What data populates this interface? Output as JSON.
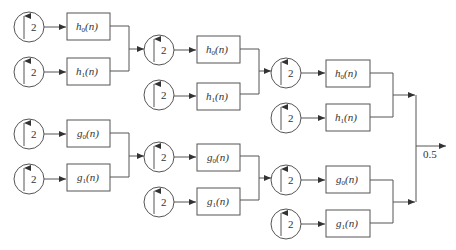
{
  "diagram": {
    "type": "synthesis filter bank tree",
    "upsample_factor": "2",
    "output_gain": "0.5",
    "stages": [
      {
        "name": "stage-1",
        "blocks": [
          {
            "filter": "h",
            "sub": "0",
            "arg": "(n)",
            "factor": "2"
          },
          {
            "filter": "h",
            "sub": "1",
            "arg": "(n)",
            "factor": "2"
          },
          {
            "filter": "g",
            "sub": "0",
            "arg": "(n)",
            "factor": "2"
          },
          {
            "filter": "g",
            "sub": "1",
            "arg": "(n)",
            "factor": "2"
          }
        ]
      },
      {
        "name": "stage-2",
        "blocks": [
          {
            "filter": "h",
            "sub": "0",
            "arg": "(n)",
            "factor": "2"
          },
          {
            "filter": "h",
            "sub": "1",
            "arg": "(n)",
            "factor": "2"
          },
          {
            "filter": "g",
            "sub": "0",
            "arg": "(n)",
            "factor": "2"
          },
          {
            "filter": "g",
            "sub": "1",
            "arg": "(n)",
            "factor": "2"
          }
        ]
      },
      {
        "name": "stage-3",
        "blocks": [
          {
            "filter": "h",
            "sub": "0",
            "arg": "(n)",
            "factor": "2"
          },
          {
            "filter": "h",
            "sub": "1",
            "arg": "(n)",
            "factor": "2"
          },
          {
            "filter": "g",
            "sub": "0",
            "arg": "(n)",
            "factor": "2"
          },
          {
            "filter": "g",
            "sub": "1",
            "arg": "(n)",
            "factor": "2"
          }
        ]
      }
    ],
    "colors": {
      "stroke": "#555555",
      "text": "#333333",
      "background": "#ffffff"
    }
  }
}
